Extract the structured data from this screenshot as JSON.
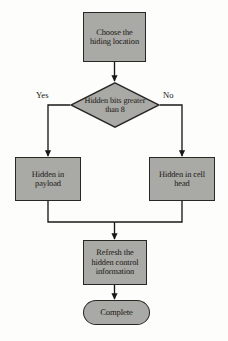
{
  "diagram": {
    "type": "flowchart",
    "style": {
      "node_fill": "#a9a9a6",
      "node_border": "#2a2723",
      "edge_color": "#1a1814",
      "background": "#fdfdfc"
    },
    "nodes": [
      {
        "id": "choose",
        "shape": "process",
        "text": "Choose the hiding location"
      },
      {
        "id": "decision",
        "shape": "decision",
        "text": "Hidden bits greater than 8"
      },
      {
        "id": "payload",
        "shape": "process",
        "text": "Hidden in payload"
      },
      {
        "id": "cellhead",
        "shape": "process",
        "text": "Hidden in cell head"
      },
      {
        "id": "refresh",
        "shape": "process",
        "text": "Refresh the hidden control information"
      },
      {
        "id": "complete",
        "shape": "terminal",
        "text": "Complete"
      }
    ],
    "edges": [
      {
        "from": "choose",
        "to": "decision",
        "label": ""
      },
      {
        "from": "decision",
        "to": "payload",
        "label": "Yes"
      },
      {
        "from": "decision",
        "to": "cellhead",
        "label": "No"
      },
      {
        "from": "payload",
        "to": "refresh",
        "label": ""
      },
      {
        "from": "cellhead",
        "to": "refresh",
        "label": ""
      },
      {
        "from": "refresh",
        "to": "complete",
        "label": ""
      }
    ],
    "labels": {
      "yes": "Yes",
      "no": "No"
    }
  }
}
